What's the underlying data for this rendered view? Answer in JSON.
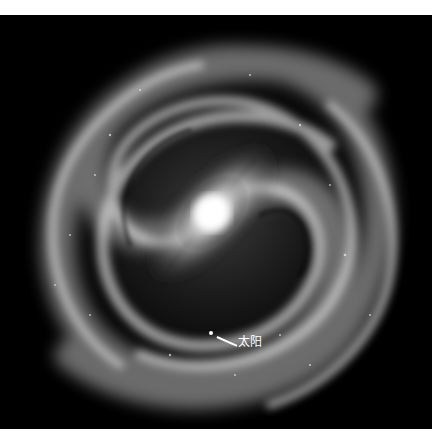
{
  "image": {
    "subject": "spiral-galaxy-milky-way-illustration",
    "background_color": "#000000",
    "page_background": "#ffffff"
  },
  "galaxy": {
    "center": {
      "x": 212,
      "y": 198
    },
    "core_color": "#ffffff",
    "arm_color": "#cfcfcf"
  },
  "annotation": {
    "label": "太阳",
    "dot": {
      "x": 211,
      "y": 318
    },
    "line": {
      "x1": 217,
      "y1": 321,
      "x2": 237,
      "y2": 330
    },
    "label_pos": {
      "x": 238,
      "y": 320
    },
    "color": "#ffffff"
  }
}
